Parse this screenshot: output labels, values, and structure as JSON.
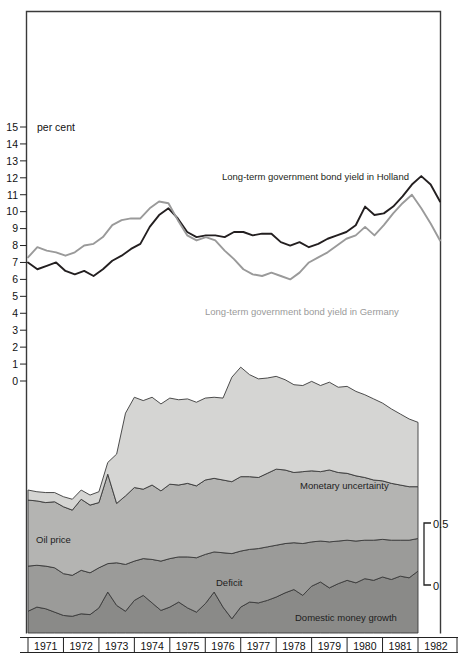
{
  "figure": {
    "unit_label": "per cent",
    "left_axis": {
      "ticks": [
        "15",
        "14",
        "13",
        "12",
        "11",
        "10",
        "9",
        "8",
        "7",
        "6",
        "5",
        "4",
        "3",
        "2",
        "1",
        "0"
      ],
      "min": 0,
      "max": 15
    },
    "right_axis": {
      "top_label": "0.5",
      "bottom_label": "0",
      "min": 0,
      "max": 0.5
    },
    "x_axis": {
      "years": [
        "1971",
        "1972",
        "1973",
        "1974",
        "1975",
        "1976",
        "1977",
        "1978",
        "1979",
        "1980",
        "1981",
        "1982"
      ]
    },
    "annotations": {
      "holland_line": "Long-term government bond yield in Holland",
      "germany_line": "Long-term government bond yield in Germany",
      "band_monetary": "Monetary uncertainty",
      "band_oil": "Oil price",
      "band_deficit": "Deficit",
      "band_money": "Domestic money growth"
    },
    "colors": {
      "holland": "#231f20",
      "germany": "#9a9a9a",
      "band_monetary": "#d5d5d3",
      "band_oil": "#b4b4b2",
      "band_deficit": "#9b9b99",
      "band_money": "#8a8a88",
      "frame": "#3a3a3a"
    }
  },
  "chart_data": {
    "type": "line",
    "title": "",
    "xlabel": "",
    "ylabel": "per cent",
    "ylim": [
      0,
      15
    ],
    "xlim": [
      1971,
      1982
    ],
    "grid": false,
    "legend": "inline-annotations",
    "x": [
      1971.0,
      1971.25,
      1971.5,
      1971.75,
      1972.0,
      1972.25,
      1972.5,
      1972.75,
      1973.0,
      1973.25,
      1973.5,
      1973.75,
      1974.0,
      1974.25,
      1974.5,
      1974.75,
      1975.0,
      1975.25,
      1975.5,
      1975.75,
      1976.0,
      1976.25,
      1976.5,
      1976.75,
      1977.0,
      1977.25,
      1977.5,
      1977.75,
      1978.0,
      1978.25,
      1978.5,
      1978.75,
      1979.0,
      1979.25,
      1979.5,
      1979.75,
      1980.0,
      1980.25,
      1980.5,
      1980.75,
      1981.0,
      1981.25,
      1981.5,
      1981.75,
      1982.0
    ],
    "series": [
      {
        "name": "Long-term government bond yield in Holland",
        "color": "#231f20",
        "values": [
          7.0,
          6.6,
          6.8,
          7.0,
          6.5,
          6.3,
          6.5,
          6.2,
          6.6,
          7.1,
          7.4,
          7.8,
          8.1,
          9.1,
          9.8,
          10.2,
          9.6,
          8.8,
          8.5,
          8.6,
          8.6,
          8.5,
          8.8,
          8.8,
          8.6,
          8.7,
          8.7,
          8.2,
          8.0,
          8.2,
          7.9,
          8.1,
          8.4,
          8.6,
          8.8,
          9.2,
          10.3,
          9.8,
          9.9,
          10.3,
          10.9,
          11.6,
          12.1,
          11.6,
          10.6
        ]
      },
      {
        "name": "Long-term government bond yield in Germany",
        "color": "#9a9a9a",
        "values": [
          7.3,
          7.9,
          7.7,
          7.6,
          7.4,
          7.6,
          8.0,
          8.1,
          8.5,
          9.2,
          9.5,
          9.6,
          9.6,
          10.2,
          10.6,
          10.5,
          9.5,
          8.6,
          8.3,
          8.5,
          8.3,
          7.7,
          7.2,
          6.6,
          6.3,
          6.2,
          6.4,
          6.2,
          6.0,
          6.4,
          7.0,
          7.3,
          7.6,
          8.0,
          8.4,
          8.6,
          9.1,
          8.6,
          9.2,
          9.9,
          10.5,
          11.0,
          10.2,
          9.3,
          8.3
        ]
      }
    ],
    "stacked_area": {
      "type": "area",
      "stacked": true,
      "ylim": [
        0,
        0.5
      ],
      "x": [
        1971.0,
        1971.25,
        1971.5,
        1971.75,
        1972.0,
        1972.25,
        1972.5,
        1972.75,
        1973.0,
        1973.25,
        1973.5,
        1973.75,
        1974.0,
        1974.25,
        1974.5,
        1974.75,
        1975.0,
        1975.25,
        1975.5,
        1975.75,
        1976.0,
        1976.25,
        1976.5,
        1976.75,
        1977.0,
        1977.25,
        1977.5,
        1977.75,
        1978.0,
        1978.25,
        1978.5,
        1978.75,
        1979.0,
        1979.25,
        1979.5,
        1979.75,
        1980.0,
        1980.25,
        1980.5,
        1980.75,
        1981.0,
        1981.25,
        1981.5,
        1981.75,
        1982.0
      ],
      "bands": [
        {
          "name": "Domestic money growth",
          "color": "#8a8a88",
          "values": [
            0.052,
            0.062,
            0.058,
            0.05,
            0.042,
            0.04,
            0.046,
            0.044,
            0.06,
            0.098,
            0.066,
            0.052,
            0.078,
            0.09,
            0.072,
            0.054,
            0.062,
            0.074,
            0.06,
            0.05,
            0.07,
            0.098,
            0.062,
            0.034,
            0.062,
            0.074,
            0.072,
            0.078,
            0.086,
            0.096,
            0.104,
            0.09,
            0.112,
            0.122,
            0.108,
            0.118,
            0.126,
            0.12,
            0.13,
            0.126,
            0.134,
            0.128,
            0.136,
            0.132,
            0.148
          ]
        },
        {
          "name": "Deficit",
          "color": "#9b9b99",
          "values": [
            0.108,
            0.1,
            0.102,
            0.106,
            0.1,
            0.098,
            0.104,
            0.1,
            0.096,
            0.068,
            0.102,
            0.112,
            0.094,
            0.088,
            0.104,
            0.118,
            0.116,
            0.108,
            0.122,
            0.13,
            0.118,
            0.096,
            0.13,
            0.156,
            0.134,
            0.126,
            0.13,
            0.128,
            0.124,
            0.118,
            0.112,
            0.124,
            0.106,
            0.098,
            0.11,
            0.102,
            0.096,
            0.1,
            0.092,
            0.096,
            0.09,
            0.094,
            0.086,
            0.09,
            0.078
          ]
        },
        {
          "name": "Oil price",
          "color": "#b4b4b2",
          "values": [
            0.158,
            0.154,
            0.152,
            0.158,
            0.16,
            0.156,
            0.17,
            0.162,
            0.156,
            0.214,
            0.142,
            0.164,
            0.176,
            0.166,
            0.178,
            0.168,
            0.178,
            0.172,
            0.176,
            0.172,
            0.178,
            0.176,
            0.174,
            0.172,
            0.178,
            0.174,
            0.17,
            0.176,
            0.182,
            0.176,
            0.168,
            0.172,
            0.17,
            0.166,
            0.172,
            0.164,
            0.16,
            0.156,
            0.15,
            0.144,
            0.14,
            0.136,
            0.132,
            0.128,
            0.124
          ]
        },
        {
          "name": "Monetary uncertainty",
          "color": "#d5d5d3",
          "values": [
            0.024,
            0.022,
            0.024,
            0.022,
            0.024,
            0.026,
            0.022,
            0.024,
            0.026,
            0.028,
            0.118,
            0.198,
            0.216,
            0.212,
            0.21,
            0.208,
            0.206,
            0.204,
            0.202,
            0.2,
            0.196,
            0.194,
            0.196,
            0.25,
            0.262,
            0.244,
            0.236,
            0.228,
            0.222,
            0.216,
            0.21,
            0.206,
            0.214,
            0.206,
            0.21,
            0.204,
            0.208,
            0.202,
            0.198,
            0.194,
            0.186,
            0.178,
            0.17,
            0.162,
            0.154
          ]
        }
      ]
    }
  }
}
